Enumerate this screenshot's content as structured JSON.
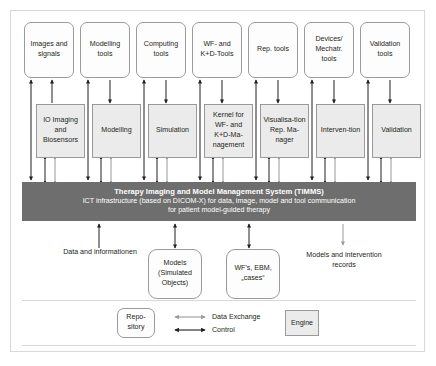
{
  "diagram": {
    "title": "Therapy Imaging and Model Management System (TIMMS)",
    "accent_dark": "#6e6e6e",
    "engine_fill": "#ebebeb",
    "control_arrow_color": "#231f20",
    "data_exchange_arrow_color": "#9a9a9a"
  },
  "tool_row": [
    {
      "label": "Images and signals"
    },
    {
      "label": "Modelling tools"
    },
    {
      "label": "Computing tools"
    },
    {
      "label": "WF- and K+D-Tools"
    },
    {
      "label": "Rep. tools"
    },
    {
      "label": "Devices/ Mechatr. tools"
    },
    {
      "label": "Validation tools"
    }
  ],
  "engine_row": [
    {
      "label": "IO Imaging and Biosensors"
    },
    {
      "label": "Modelling"
    },
    {
      "label": "Simulation"
    },
    {
      "label": "Kernel for WF- and K+D-Ma-nagement"
    },
    {
      "label": "Visualisa-tion Rep. Ma-nager"
    },
    {
      "label": "Interven-tion"
    },
    {
      "label": "Validation"
    }
  ],
  "timms": {
    "line1": "Therapy Imaging and Model Management System (TIMMS)",
    "line2": "ICT infrastructure (based on DICOM-X) for data, image, model and tool communication",
    "line3": "for patient model-guided therapy"
  },
  "bottom": {
    "caption_left": "Data and informationen",
    "repo_models": "Models (Simulated Objects)",
    "repo_wf": "WF's, EBM, „cases“",
    "caption_right": "Models and intervention records"
  },
  "legend": {
    "repository_label": "Repo-sitory",
    "data_exchange_label": "Data Exchange",
    "control_label": "Control",
    "engine_label": "Engine"
  }
}
